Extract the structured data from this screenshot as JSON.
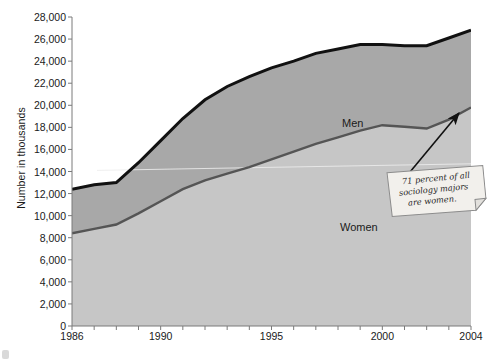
{
  "chart_data": {
    "type": "area",
    "title": "",
    "xlabel": "",
    "ylabel": "Number in thousands",
    "x": [
      1986,
      1987,
      1988,
      1989,
      1990,
      1991,
      1992,
      1993,
      1994,
      1995,
      1996,
      1997,
      1998,
      1999,
      2000,
      2001,
      2002,
      2003,
      2004
    ],
    "xlim": [
      1986,
      2004
    ],
    "ylim": [
      0,
      28000
    ],
    "xticklabels": [
      "1986",
      "1990",
      "1995",
      "2000",
      "2004"
    ],
    "xticklabel_years": [
      1986,
      1990,
      1995,
      2000,
      2004
    ],
    "yticklabels": [
      "0",
      "2,000",
      "4,000",
      "6,000",
      "8,000",
      "10,000",
      "12,000",
      "14,000",
      "16,000",
      "18,000",
      "20,000",
      "22,000",
      "24,000",
      "26,000",
      "28,000"
    ],
    "ytickvalues": [
      0,
      2000,
      4000,
      6000,
      8000,
      10000,
      12000,
      14000,
      16000,
      18000,
      20000,
      22000,
      24000,
      26000,
      28000
    ],
    "ytick_step": 2000,
    "stacked": true,
    "grid": false,
    "legend_position": "inline-labels",
    "series": [
      {
        "name": "Women",
        "label_x": 1995,
        "label_y": 6500,
        "values": [
          8400,
          8800,
          9200,
          10200,
          11300,
          12400,
          13200,
          13800,
          14400,
          15100,
          15800,
          16500,
          17100,
          17700,
          18200,
          18050,
          17900,
          18700,
          19800
        ],
        "line_color": "#555555",
        "fill_color": "#c6c6c6"
      },
      {
        "name": "Men",
        "label_x": 1995,
        "label_y": 19500,
        "values": [
          4000,
          4000,
          3800,
          4600,
          5500,
          6400,
          7300,
          7900,
          8200,
          8300,
          8200,
          8200,
          8000,
          7800,
          7300,
          7350,
          7500,
          7400,
          7000
        ],
        "line_color": "#111111",
        "fill_color": "#a8a8a8"
      }
    ],
    "totals": [
      12400,
      12800,
      13000,
      14800,
      16800,
      18800,
      20500,
      21700,
      22600,
      23400,
      24000,
      24700,
      25100,
      25500,
      25500,
      25400,
      25400,
      26100,
      26800
    ],
    "annotations": [
      {
        "text": "71 percent of all sociology majors are women.",
        "lines": [
          "71 percent of all",
          "sociology majors",
          "are women."
        ],
        "style": "sticky-note",
        "points_to_x": 2004,
        "points_to_y": 19800
      }
    ]
  },
  "axis": {
    "y_title": "Number in thousands"
  },
  "colors": {
    "plot_background": "#d5d5d5",
    "women_fill": "#c6c6c6",
    "men_fill": "#a8a8a8",
    "women_line": "#555555",
    "men_line": "#111111",
    "axis_line": "#7a7a7a",
    "note_background": "#f2f0ec",
    "note_border": "#8c8c8c",
    "arrow": "#111111",
    "text": "#1a1a1a"
  }
}
